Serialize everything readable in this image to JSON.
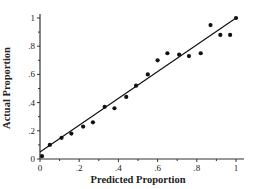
{
  "chart_data": {
    "type": "scatter",
    "title": "",
    "xlabel": "Predicted Proportion",
    "ylabel": "Actual Proportion",
    "xlim": [
      0,
      1
    ],
    "ylim": [
      0,
      1
    ],
    "x_ticks": [
      "0",
      ".2",
      ".4",
      ".6",
      ".8",
      "1"
    ],
    "y_ticks": [
      "0",
      ".2",
      ".4",
      ".6",
      ".8",
      "1"
    ],
    "x_tick_values": [
      0,
      0.2,
      0.4,
      0.6,
      0.8,
      1
    ],
    "y_tick_values": [
      0,
      0.2,
      0.4,
      0.6,
      0.8,
      1
    ],
    "minor_ticks": true,
    "grid": false,
    "legend": null,
    "series": [
      {
        "name": "observations",
        "marker": "filled-circle",
        "color": "#111111",
        "x": [
          0.01,
          0.05,
          0.11,
          0.16,
          0.22,
          0.27,
          0.33,
          0.38,
          0.44,
          0.49,
          0.55,
          0.6,
          0.65,
          0.71,
          0.76,
          0.82,
          0.87,
          0.92,
          0.97,
          1.0
        ],
        "y": [
          0.02,
          0.1,
          0.15,
          0.18,
          0.23,
          0.26,
          0.37,
          0.36,
          0.44,
          0.52,
          0.6,
          0.7,
          0.75,
          0.74,
          0.73,
          0.75,
          0.95,
          0.88,
          0.88,
          1.0
        ]
      }
    ],
    "fit_line": {
      "name": "regression fit",
      "color": "#111111",
      "x": [
        0,
        1
      ],
      "y": [
        0.05,
        1.0
      ]
    }
  }
}
